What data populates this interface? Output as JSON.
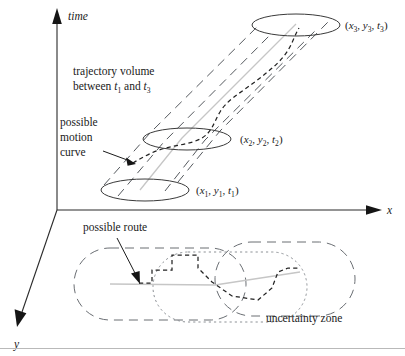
{
  "figure": {
    "kind": "3d-spatiotemporal-trajectory-diagram",
    "axes": {
      "time_label": "time",
      "x_label": "x",
      "y_label": "y"
    },
    "annotations": {
      "trajectory_volume_line1": "trajectory volume",
      "trajectory_volume_line2_pre": "between ",
      "trajectory_volume_t1_base": "t",
      "trajectory_volume_t1_sub": "1",
      "trajectory_volume_mid": " and ",
      "trajectory_volume_t3_base": "t",
      "trajectory_volume_t3_sub": "3",
      "possible_motion_line1": "possible",
      "possible_motion_line2": "motion",
      "possible_motion_line3": "curve",
      "possible_route": "possible route",
      "uncertainty_zone": "uncertainty zone"
    },
    "points": [
      {
        "id": "p1",
        "label": "(x₁, y₁, t₁)",
        "x_base": "x",
        "x_sub": "1",
        "y_base": "y",
        "y_sub": "1",
        "t_base": "t",
        "t_sub": "1"
      },
      {
        "id": "p2",
        "label": "(x₂, y₂, t₂)",
        "x_base": "x",
        "x_sub": "2",
        "y_base": "y",
        "y_sub": "2",
        "t_base": "t",
        "t_sub": "2"
      },
      {
        "id": "p3",
        "label": "(x₃, y₃, t₃)",
        "x_base": "x",
        "x_sub": "3",
        "y_base": "y",
        "y_sub": "3",
        "t_base": "t",
        "t_sub": "3"
      }
    ],
    "colors": {
      "ink": "#1a1a1a",
      "axis": "#2a2a2a",
      "volume_dash": "#55595e",
      "motion_dash": "#232323",
      "center_line": "#c6c6c6",
      "zone_dash": "#6a6e73",
      "zone_dot": "#8d9196",
      "rule": "#b9b9b9",
      "background": "#ffffff"
    }
  }
}
